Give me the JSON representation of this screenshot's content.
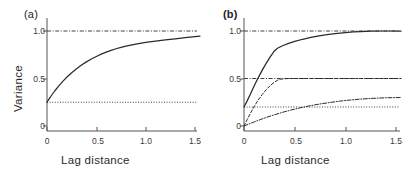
{
  "figure": {
    "width": 406,
    "height": 175,
    "background": "#ffffff",
    "line_color": "#2b2b2b"
  },
  "panels": [
    {
      "id": "a",
      "label": "(a)",
      "label_bold": false,
      "xlabel": "Lag  distance",
      "ylabel": "Variance",
      "show_ylabel": true,
      "xticks": [
        "0",
        "0.5",
        "1.0",
        "1.5"
      ],
      "xtick_values": [
        0,
        0.5,
        1.0,
        1.5
      ],
      "yticks": [
        "0",
        "0.5",
        "1.0"
      ],
      "ytick_values": [
        0,
        0.5,
        1.0
      ],
      "xlim": [
        0,
        1.55
      ],
      "ylim": [
        0,
        1.12
      ]
    },
    {
      "id": "b",
      "label": "(b)",
      "label_bold": true,
      "xlabel": "Lag  distance",
      "ylabel": "",
      "show_ylabel": false,
      "xticks": [
        "0",
        "0.5",
        "1.0",
        "1.5"
      ],
      "xtick_values": [
        0,
        0.5,
        1.0,
        1.5
      ],
      "yticks": [
        "0",
        "0.5",
        "1.0"
      ],
      "ytick_values": [
        0,
        0.5,
        1.0
      ],
      "xlim": [
        0,
        1.55
      ],
      "ylim": [
        0,
        1.12
      ]
    }
  ],
  "chart_data": [
    {
      "type": "line",
      "panel": "a",
      "title": "(a)",
      "xlabel": "Lag  distance",
      "ylabel": "Variance",
      "xlim": [
        0,
        1.55
      ],
      "ylim": [
        0,
        1.12
      ],
      "xticks": [
        0,
        0.5,
        1.0,
        1.5
      ],
      "yticks": [
        0,
        0.5,
        1.0
      ],
      "grid": false,
      "legend": "none",
      "series": [
        {
          "name": "exponential variogram with nugget",
          "style": "solid",
          "color": "#2b2b2b",
          "nugget": 0.25,
          "sill": 1.0,
          "range": 0.45,
          "x": [
            0.0,
            0.02,
            0.05,
            0.08,
            0.12,
            0.16,
            0.2,
            0.25,
            0.3,
            0.35,
            0.4,
            0.45,
            0.5,
            0.55,
            0.6,
            0.65,
            0.7,
            0.75,
            0.8,
            0.9,
            1.0,
            1.1,
            1.2,
            1.3,
            1.4,
            1.5,
            1.55
          ],
          "y": [
            0.25,
            0.283,
            0.329,
            0.371,
            0.423,
            0.47,
            0.513,
            0.561,
            0.603,
            0.641,
            0.675,
            0.705,
            0.732,
            0.756,
            0.777,
            0.796,
            0.813,
            0.828,
            0.841,
            0.863,
            0.88,
            0.894,
            0.906,
            0.918,
            0.929,
            0.94,
            0.945
          ]
        },
        {
          "name": "sill reference line",
          "style": "dash-dot",
          "color": "#2b2b2b",
          "value": 1.0,
          "orientation": "horizontal"
        },
        {
          "name": "nugget reference line",
          "style": "dotted",
          "color": "#2b2b2b",
          "value": 0.25,
          "orientation": "horizontal"
        }
      ]
    },
    {
      "type": "line",
      "panel": "b",
      "title": "(b)",
      "xlabel": "Lag  distance",
      "ylabel": "",
      "xlim": [
        0,
        1.55
      ],
      "ylim": [
        0,
        1.12
      ],
      "xticks": [
        0,
        0.5,
        1.0,
        1.5
      ],
      "yticks": [
        0,
        0.5,
        1.0
      ],
      "grid": false,
      "legend": "none",
      "series": [
        {
          "name": "total nested variogram",
          "style": "solid",
          "color": "#2b2b2b",
          "nugget": 0.2,
          "sill": 1.0,
          "x": [
            0.0,
            0.03,
            0.06,
            0.1,
            0.14,
            0.18,
            0.22,
            0.26,
            0.3,
            0.33,
            0.38,
            0.44,
            0.5,
            0.58,
            0.66,
            0.74,
            0.82,
            0.9,
            1.0,
            1.08,
            1.15,
            1.25,
            1.4,
            1.55
          ],
          "y": [
            0.2,
            0.262,
            0.33,
            0.42,
            0.507,
            0.588,
            0.662,
            0.73,
            0.79,
            0.818,
            0.845,
            0.87,
            0.89,
            0.913,
            0.932,
            0.948,
            0.961,
            0.972,
            0.983,
            0.99,
            0.994,
            0.998,
            1.0,
            1.0
          ]
        },
        {
          "name": "short-range structure (sill 0.5)",
          "style": "dashed",
          "color": "#2b2b2b",
          "sill": 0.5,
          "x": [
            0.0,
            0.03,
            0.06,
            0.1,
            0.14,
            0.18,
            0.22,
            0.26,
            0.3,
            0.33,
            0.36,
            0.4,
            0.45,
            0.5,
            0.6,
            0.75,
            0.9,
            1.1,
            1.3,
            1.55
          ],
          "y": [
            0.0,
            0.065,
            0.128,
            0.205,
            0.273,
            0.332,
            0.383,
            0.427,
            0.462,
            0.481,
            0.492,
            0.498,
            0.5,
            0.5,
            0.5,
            0.5,
            0.5,
            0.5,
            0.5,
            0.5
          ]
        },
        {
          "name": "long-range structure (sill 0.3)",
          "style": "dash-dot",
          "color": "#2b2b2b",
          "sill": 0.3,
          "x": [
            0.0,
            0.05,
            0.1,
            0.16,
            0.22,
            0.3,
            0.38,
            0.46,
            0.55,
            0.65,
            0.75,
            0.85,
            0.95,
            1.05,
            1.15,
            1.25,
            1.4,
            1.55
          ],
          "y": [
            0.0,
            0.022,
            0.043,
            0.067,
            0.09,
            0.118,
            0.144,
            0.167,
            0.19,
            0.213,
            0.232,
            0.248,
            0.262,
            0.274,
            0.283,
            0.29,
            0.297,
            0.3
          ]
        },
        {
          "name": "total sill reference line",
          "style": "dash-dot",
          "color": "#2b2b2b",
          "value": 1.0,
          "orientation": "horizontal"
        },
        {
          "name": "short-range sill reference line",
          "style": "dash-dot",
          "color": "#2b2b2b",
          "value": 0.5,
          "orientation": "horizontal"
        },
        {
          "name": "nugget reference line",
          "style": "dotted",
          "color": "#2b2b2b",
          "value": 0.2,
          "orientation": "horizontal"
        }
      ]
    }
  ]
}
